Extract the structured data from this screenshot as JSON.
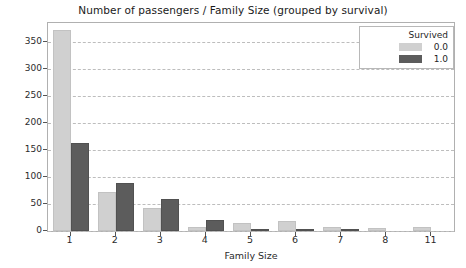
{
  "chart_data": {
    "type": "bar",
    "title": "Number of passengers / Family Size (grouped by survival)",
    "xlabel": "Family Size",
    "ylabel": "count",
    "categories": [
      "1",
      "2",
      "3",
      "4",
      "5",
      "6",
      "7",
      "8",
      "11"
    ],
    "series": [
      {
        "name": "0.0",
        "color": "#d0d0d0",
        "values": [
          372,
          72,
          43,
          8,
          15,
          19,
          8,
          6,
          7
        ]
      },
      {
        "name": "1.0",
        "color": "#5c5c5c",
        "values": [
          163,
          89,
          59,
          21,
          3,
          3,
          4,
          0,
          0
        ]
      }
    ],
    "legend": {
      "title": "Survived",
      "position": "upper-right"
    },
    "ylim": [
      0,
      385
    ],
    "yticks": [
      0,
      50,
      100,
      150,
      200,
      250,
      300,
      350
    ],
    "grid": true,
    "grid_style": "dashed"
  }
}
